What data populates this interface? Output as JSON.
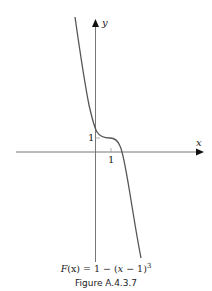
{
  "figure": {
    "caption": "Figure A.4.3.7",
    "equation": "F(x) = 1 − (x − 1)³",
    "equation_parts": {
      "lhs_func": "F",
      "lhs_var": "(x)",
      "rhs_prefix": " = 1 − (",
      "rhs_var": "x",
      "rhs_suffix": " − 1)",
      "exponent": "3"
    },
    "axes": {
      "x_label": "x",
      "y_label": "y",
      "x_tick_label": "1",
      "y_tick_label": "1"
    },
    "colors": {
      "curve": "#555555",
      "axes": "#777777",
      "arrow": "#111111",
      "text": "#222222"
    }
  }
}
